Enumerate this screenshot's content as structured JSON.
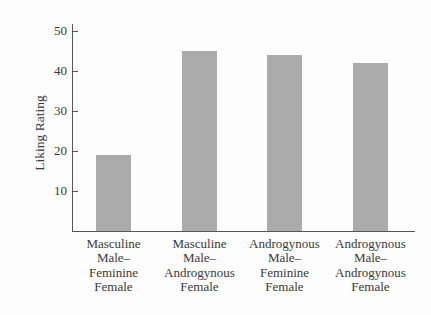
{
  "chart_data": {
    "type": "bar",
    "title": "",
    "xlabel": "",
    "ylabel": "Liking Rating",
    "ylim": [
      0,
      52
    ],
    "yticks": [
      10,
      20,
      30,
      40,
      50
    ],
    "grid": false,
    "legend": null,
    "categories": [
      "Masculine Male–Feminine Female",
      "Masculine Male–Androgynous Female",
      "Androgynous Male–Feminine Female",
      "Androgynous Male–Androgynous Female"
    ],
    "category_label_lines": [
      [
        "Masculine",
        "Male–",
        "Feminine",
        "Female"
      ],
      [
        "Masculine",
        "Male–",
        "Androgynous",
        "Female"
      ],
      [
        "Androgynous",
        "Male–",
        "Feminine",
        "Female"
      ],
      [
        "Androgynous",
        "Male–",
        "Androgynous",
        "Female"
      ]
    ],
    "values": [
      19,
      45,
      44,
      42
    ],
    "bar_color": "#ababab"
  }
}
